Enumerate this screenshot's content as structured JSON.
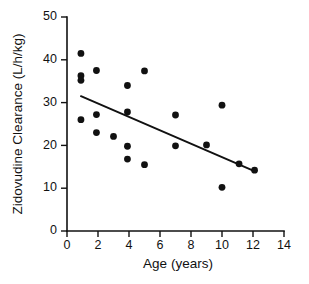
{
  "chart_data": {
    "type": "scatter",
    "title": "",
    "xlabel": "Age (years)",
    "ylabel": "Zidovudine Clearance (L/h/kg)",
    "xlim": [
      0,
      14
    ],
    "ylim": [
      0,
      50
    ],
    "xticks": [
      0,
      2,
      4,
      6,
      8,
      10,
      12,
      14
    ],
    "yticks": [
      0,
      10,
      20,
      30,
      40,
      50
    ],
    "xtick_labels": [
      "0",
      "2",
      "4",
      "6",
      "8",
      "10",
      "12",
      "14"
    ],
    "ytick_labels": [
      "0",
      "10",
      "20",
      "30",
      "40",
      "50"
    ],
    "grid": false,
    "legend": "none",
    "marker": "filled-circle",
    "marker_color": "#111111",
    "points": [
      {
        "x": 0.9,
        "y": 41.5
      },
      {
        "x": 0.9,
        "y": 36.3
      },
      {
        "x": 0.9,
        "y": 35.2
      },
      {
        "x": 0.9,
        "y": 26.0
      },
      {
        "x": 1.9,
        "y": 37.5
      },
      {
        "x": 1.9,
        "y": 27.2
      },
      {
        "x": 1.9,
        "y": 23.0
      },
      {
        "x": 3.0,
        "y": 22.1
      },
      {
        "x": 3.9,
        "y": 34.0
      },
      {
        "x": 3.9,
        "y": 27.8
      },
      {
        "x": 3.9,
        "y": 19.8
      },
      {
        "x": 3.9,
        "y": 16.8
      },
      {
        "x": 5.0,
        "y": 37.4
      },
      {
        "x": 5.0,
        "y": 15.5
      },
      {
        "x": 7.0,
        "y": 27.1
      },
      {
        "x": 7.0,
        "y": 19.9
      },
      {
        "x": 9.0,
        "y": 20.1
      },
      {
        "x": 10.0,
        "y": 29.4
      },
      {
        "x": 10.0,
        "y": 10.2
      },
      {
        "x": 11.1,
        "y": 15.7
      },
      {
        "x": 12.1,
        "y": 14.2
      }
    ],
    "fit_line": {
      "label": "regression-line",
      "x_start": 0.9,
      "y_start": 31.5,
      "x_end": 12.2,
      "y_end": 13.8
    }
  }
}
